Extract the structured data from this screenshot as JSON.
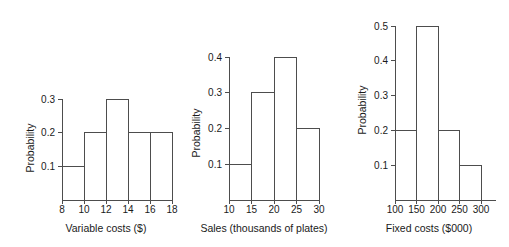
{
  "figure": {
    "background": "#ffffff",
    "line_color": "#4d4d4d",
    "text_color": "#1a1a1a"
  },
  "chart_data": [
    {
      "type": "bar",
      "title": "",
      "xlabel": "Variable costs ($)",
      "ylabel": "Probability",
      "bin_edges": [
        8,
        10,
        12,
        14,
        16,
        18
      ],
      "categories": [
        "8-10",
        "10-12",
        "12-14",
        "14-16",
        "16-18"
      ],
      "values": [
        0.1,
        0.2,
        0.3,
        0.2,
        0.2
      ],
      "xticks": [
        8,
        10,
        12,
        14,
        16,
        18
      ],
      "xticklabels": [
        "8",
        "10",
        "12",
        "14",
        "16",
        "18"
      ],
      "yticks": [
        0.1,
        0.2,
        0.3
      ],
      "yticklabels": [
        "0.1",
        "0.2",
        "0.3"
      ],
      "xlim": [
        8,
        18
      ],
      "ylim": [
        0,
        0.3
      ],
      "grid": false,
      "legend": false,
      "bar_style": "outline"
    },
    {
      "type": "bar",
      "title": "",
      "xlabel": "Sales (thousands of plates)",
      "ylabel": "Probability",
      "bin_edges": [
        10,
        15,
        20,
        25,
        30
      ],
      "categories": [
        "10-15",
        "15-20",
        "20-25",
        "25-30"
      ],
      "values": [
        0.1,
        0.3,
        0.4,
        0.2
      ],
      "xticks": [
        10,
        15,
        20,
        25,
        30
      ],
      "xticklabels": [
        "10",
        "15",
        "20",
        "25",
        "30"
      ],
      "yticks": [
        0.1,
        0.2,
        0.3,
        0.4
      ],
      "yticklabels": [
        "0.1",
        "0.2",
        "0.3",
        "0.4"
      ],
      "xlim": [
        10,
        30
      ],
      "ylim": [
        0,
        0.4
      ],
      "grid": false,
      "legend": false,
      "bar_style": "outline"
    },
    {
      "type": "bar",
      "title": "",
      "xlabel": "Fixed costs ($000)",
      "ylabel": "Probability",
      "bin_edges": [
        100,
        150,
        200,
        250,
        300
      ],
      "categories": [
        "100-150",
        "150-200",
        "200-250",
        "250-300"
      ],
      "values": [
        0.2,
        0.5,
        0.2,
        0.1
      ],
      "xticks": [
        100,
        150,
        200,
        250,
        300
      ],
      "xticklabels": [
        "100",
        "150",
        "200",
        "250",
        "300"
      ],
      "yticks": [
        0.1,
        0.2,
        0.3,
        0.4,
        0.5
      ],
      "yticklabels": [
        "0.1",
        "0.2",
        "0.3",
        "0.4",
        "0.5"
      ],
      "xlim": [
        100,
        300
      ],
      "ylim": [
        0,
        0.5
      ],
      "grid": false,
      "legend": false,
      "bar_style": "outline"
    }
  ]
}
